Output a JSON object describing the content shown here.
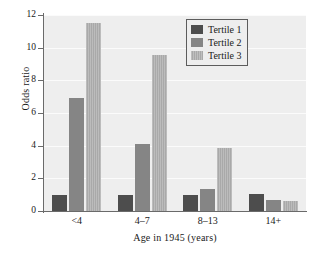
{
  "chart_data": {
    "type": "bar",
    "title": "",
    "xlabel": "Age in 1945 (years)",
    "ylabel": "Odds ratio",
    "categories": [
      "<4",
      "4–7",
      "8–13",
      "14+"
    ],
    "series": [
      {
        "name": "Tertile 1",
        "color": "#4d4d4d",
        "values": [
          0.95,
          0.95,
          0.95,
          1.05
        ]
      },
      {
        "name": "Tertile 2",
        "color": "#858585",
        "values": [
          6.9,
          4.1,
          1.35,
          0.65
        ]
      },
      {
        "name": "Tertile 3",
        "color": "#a9a9a9",
        "values": [
          11.5,
          9.55,
          3.85,
          0.62
        ]
      }
    ],
    "ylim": [
      0,
      12
    ],
    "yticks": [
      0,
      2,
      4,
      6,
      8,
      10,
      12
    ],
    "ytick_labels": [
      "0",
      "2",
      "4",
      "6",
      "8",
      "10",
      "12"
    ],
    "grid": true,
    "legend_position": "top-right",
    "plot_background": "#eeeeee"
  },
  "legend": {
    "entries": [
      "Tertile 1",
      "Tertile 2",
      "Tertile 3"
    ]
  }
}
